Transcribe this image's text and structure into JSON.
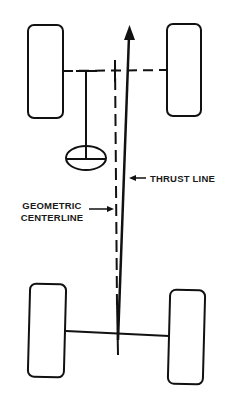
{
  "diagram": {
    "labels": {
      "thrust_line": "THRUST LINE",
      "geometric_centerline_line1": "GEOMETRIC",
      "geometric_centerline_line2": "CENTERLINE"
    },
    "components": {
      "front_left_wheel": "front-left wheel",
      "front_right_wheel": "front-right wheel",
      "rear_left_wheel": "rear-left wheel",
      "rear_right_wheel": "rear-right wheel",
      "front_axle": "front axle (dashed)",
      "rear_axle": "rear axle (solid)",
      "steering_wheel": "steering wheel symbol",
      "geometric_centerline": "geometric centerline (dashed)",
      "thrust_line": "thrust line (solid arrow)"
    },
    "colors": {
      "stroke": "#111111",
      "background": "#ffffff"
    }
  }
}
